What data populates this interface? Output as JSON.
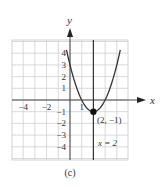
{
  "chart_data": {
    "type": "line",
    "title": "",
    "caption": "(c)",
    "xlabel": "x",
    "ylabel": "y",
    "xlim": [
      -5,
      5
    ],
    "ylim": [
      -5,
      5
    ],
    "grid": true,
    "x_tick_labels": [
      {
        "value": -4,
        "label": "−4"
      },
      {
        "value": -2,
        "label": "−2"
      },
      {
        "value": 1,
        "label": "1"
      }
    ],
    "y_tick_labels": [
      {
        "value": 4,
        "label": "4"
      },
      {
        "value": 3,
        "label": "3"
      },
      {
        "value": 2,
        "label": "2"
      },
      {
        "value": 1,
        "label": "1"
      },
      {
        "value": -1,
        "label": "−1"
      },
      {
        "value": -2,
        "label": "−2"
      },
      {
        "value": -3,
        "label": "−3"
      },
      {
        "value": -4,
        "label": "−4"
      }
    ],
    "series": [
      {
        "name": "parabola",
        "equation": "y = (x - 2)^2 - 1",
        "x_range": [
          -0.3,
          4.3
        ]
      }
    ],
    "vertical_line": {
      "x": 2,
      "label": "x = 2"
    },
    "points": [
      {
        "x": 2,
        "y": -1,
        "label": "(2, −1)"
      }
    ]
  }
}
